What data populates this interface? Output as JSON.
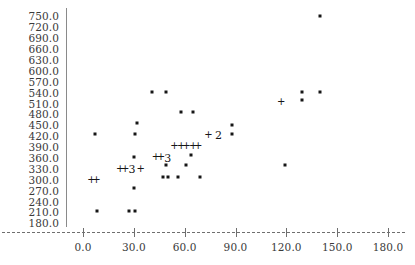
{
  "chart_data": {
    "type": "scatter",
    "title": "",
    "subtitle": "",
    "xlabel": "",
    "ylabel": "",
    "xlim": [
      -10,
      190
    ],
    "ylim": [
      170,
      762
    ],
    "grid": false,
    "legend": null,
    "x_ticks": [
      "0.0",
      "30.0",
      "60.0",
      "90.0",
      "120.0",
      "150.0",
      "180.0"
    ],
    "x_tick_values": [
      0,
      30,
      60,
      90,
      120,
      150,
      180
    ],
    "y_ticks": [
      "750.0",
      "720.0",
      "690.0",
      "660.0",
      "630.0",
      "600.0",
      "570.0",
      "540.0",
      "510.0",
      "480.0",
      "450.0",
      "420.0",
      "390.0",
      "360.0",
      "330.0",
      "300.0",
      "270.0",
      "240.0",
      "210.0",
      "180.0"
    ],
    "y_tick_values": [
      750,
      720,
      690,
      660,
      630,
      600,
      570,
      540,
      510,
      480,
      450,
      420,
      390,
      360,
      330,
      300,
      270,
      240,
      210,
      180
    ],
    "marker_symbol": "*",
    "overlap_symbol": "+",
    "points": [
      {
        "x": 140,
        "y": 750,
        "marker": "*"
      },
      {
        "x": 41,
        "y": 543,
        "marker": "*"
      },
      {
        "x": 49,
        "y": 543,
        "marker": "*"
      },
      {
        "x": 129,
        "y": 543,
        "marker": "*"
      },
      {
        "x": 140,
        "y": 543,
        "marker": "*"
      },
      {
        "x": 129,
        "y": 521,
        "marker": "*"
      },
      {
        "x": 58,
        "y": 487,
        "marker": "*"
      },
      {
        "x": 65,
        "y": 487,
        "marker": "*"
      },
      {
        "x": 32,
        "y": 457,
        "marker": "*"
      },
      {
        "x": 88,
        "y": 452,
        "marker": "*"
      },
      {
        "x": 7,
        "y": 427,
        "marker": "*"
      },
      {
        "x": 31,
        "y": 427,
        "marker": "*"
      },
      {
        "x": 88,
        "y": 425,
        "marker": "*"
      },
      {
        "x": 64,
        "y": 368,
        "marker": "*"
      },
      {
        "x": 30,
        "y": 362,
        "marker": "*"
      },
      {
        "x": 61,
        "y": 341,
        "marker": "*"
      },
      {
        "x": 49,
        "y": 341,
        "marker": "*"
      },
      {
        "x": 119,
        "y": 341,
        "marker": "*"
      },
      {
        "x": 47,
        "y": 307,
        "marker": "*"
      },
      {
        "x": 50,
        "y": 307,
        "marker": "*"
      },
      {
        "x": 56,
        "y": 307,
        "marker": "*"
      },
      {
        "x": 69,
        "y": 307,
        "marker": "*"
      },
      {
        "x": 30,
        "y": 277,
        "marker": "*"
      },
      {
        "x": 8,
        "y": 214,
        "marker": "*"
      },
      {
        "x": 27,
        "y": 214,
        "marker": "*"
      },
      {
        "x": 31,
        "y": 214,
        "marker": "*"
      }
    ],
    "overlap_markers": [
      {
        "x": 117,
        "y": 513,
        "label": "+",
        "count": 2
      },
      {
        "x": 74,
        "y": 424,
        "label": "+",
        "count": 2
      },
      {
        "x": 54,
        "y": 393,
        "label": "+",
        "count": 2
      },
      {
        "x": 58,
        "y": 393,
        "label": "+",
        "count": 2
      },
      {
        "x": 61,
        "y": 393,
        "label": "+",
        "count": 2
      },
      {
        "x": 65,
        "y": 393,
        "label": "+",
        "count": 2
      },
      {
        "x": 68,
        "y": 393,
        "label": "+",
        "count": 2
      },
      {
        "x": 43,
        "y": 362,
        "label": "+",
        "count": 2
      },
      {
        "x": 46,
        "y": 362,
        "label": "+",
        "count": 2
      },
      {
        "x": 22,
        "y": 330,
        "label": "+",
        "count": 2
      },
      {
        "x": 25,
        "y": 330,
        "label": "+",
        "count": 2
      },
      {
        "x": 34,
        "y": 330,
        "label": "+",
        "count": 2
      },
      {
        "x": 5,
        "y": 300,
        "label": "+",
        "count": 2
      },
      {
        "x": 8,
        "y": 300,
        "label": "+",
        "count": 2
      }
    ],
    "count_markers": [
      {
        "x": 80,
        "y": 424,
        "label": "2",
        "count": 2
      },
      {
        "x": 50,
        "y": 361,
        "label": "3",
        "count": 3
      },
      {
        "x": 29,
        "y": 329,
        "label": "3",
        "count": 3
      }
    ]
  }
}
